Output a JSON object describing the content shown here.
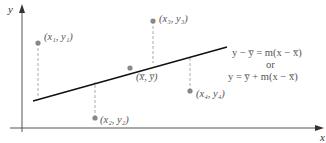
{
  "diagram": {
    "axes": {
      "x_label": "x",
      "y_label": "y"
    },
    "points": [
      {
        "id": "p1",
        "label": "(x₁, y₁)",
        "x": 38,
        "y": 43,
        "line_y": 98
      },
      {
        "id": "p2",
        "label": "(x₂, y₂)",
        "x": 95,
        "y": 118,
        "line_y": 79
      },
      {
        "id": "p3",
        "label": "(x₃, y₃)",
        "x": 153,
        "y": 21,
        "line_y": 63
      },
      {
        "id": "p4",
        "label": "(x₄, y₄)",
        "x": 190,
        "y": 91,
        "line_y": 57
      }
    ],
    "mean_point": {
      "label": "(x̅, y̅)",
      "x": 130,
      "y": 68
    },
    "regression_line": {
      "x1": 33,
      "y1": 101,
      "x2": 227,
      "y2": 47
    },
    "equations": {
      "line1": "y − y̅ = m(x − x̅)",
      "connector": "or",
      "line2": "y = y̅ + m(x − x̅)"
    },
    "colors": {
      "axis": "#555555",
      "line": "#111111",
      "point": "#888888",
      "dashed": "#aaaaaa",
      "text": "#555555"
    }
  }
}
